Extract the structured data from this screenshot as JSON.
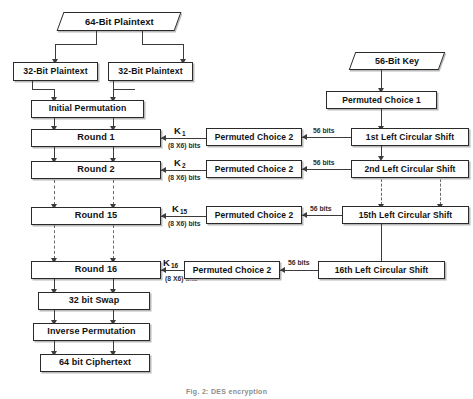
{
  "figure": {
    "caption": "Fig. 2:  DES encryption",
    "width": 473,
    "height": 399,
    "background": "#ffffff",
    "line_color": "#3b3b3b",
    "text_color": "#111111"
  },
  "data_nodes": {
    "plaintext_64": "64-Bit Plaintext",
    "key_56": "56-Bit Key"
  },
  "left_column": {
    "plaintext_left": "32-Bit Plaintext",
    "plaintext_right": "32-Bit Plaintext",
    "initial_permutation": "Initial Permutation",
    "round_1": "Round 1",
    "round_2": "Round 2",
    "round_15": "Round 15",
    "round_16": "Round 16",
    "swap_32": "32 bit Swap",
    "inverse_permutation": "Inverse Permutation",
    "ciphertext_64": "64 bit Ciphertext"
  },
  "middle_column": {
    "permuted_choice_2_r1": "Permuted Choice 2",
    "permuted_choice_2_r2": "Permuted Choice 2",
    "permuted_choice_2_r15": "Permuted Choice 2",
    "permuted_choice_2_r16": "Permuted Choice 2"
  },
  "right_column": {
    "permuted_choice_1": "Permuted Choice 1",
    "shift_1": "1st Left Circular Shift",
    "shift_2": "2nd Left Circular Shift",
    "shift_15": "15th Left Circular Shift",
    "shift_16": "16th Left Circular Shift"
  },
  "subkey_labels": {
    "k1": "K",
    "k1_sub": "1",
    "k2": "K",
    "k2_sub": "2",
    "k15": "K",
    "k15_sub": "15",
    "k16": "K",
    "k16_sub": "16",
    "width_note": "(8 X6) bits"
  },
  "bit_labels": {
    "bits_56_r1": "56 bits",
    "bits_56_r2": "56 bits",
    "bits_56_r15": "56 bits",
    "bits_56_r16": "56 bits"
  }
}
